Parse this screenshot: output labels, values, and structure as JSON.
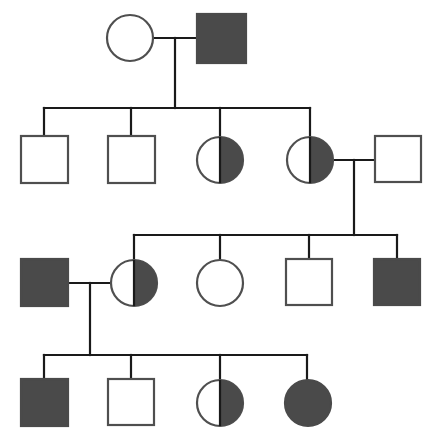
{
  "figure": {
    "kind": "pedigree-chart",
    "width": 439,
    "height": 447,
    "background_color": "#ffffff"
  },
  "style": {
    "line_color": "#1a1a1a",
    "line_width": 2.2,
    "shape_stroke_color": "#4f4f4f",
    "shape_stroke_width": 2.2,
    "affected_fill": "#4a4a4a",
    "unaffected_fill": "#ffffff",
    "carrier_fill": "#4a4a4a",
    "divider_color": "#1a1a1a"
  },
  "legend_semantics": {
    "square": "male",
    "circle": "female",
    "filled": "affected",
    "half-filled": "carrier",
    "empty": "unaffected"
  },
  "chart_data": {
    "type": "pedigree",
    "title": "",
    "generations": 4,
    "individuals": [
      {
        "id": "I-1",
        "generation": 1,
        "sex": "female",
        "shape": "circle",
        "status": "unaffected",
        "fill": "empty",
        "cx": 130,
        "cy": 38,
        "r": 23
      },
      {
        "id": "I-2",
        "generation": 1,
        "sex": "male",
        "shape": "square",
        "status": "affected",
        "fill": "full",
        "x": 197,
        "y": 14,
        "size": 49
      },
      {
        "id": "II-1",
        "generation": 2,
        "sex": "male",
        "shape": "square",
        "status": "unaffected",
        "fill": "empty",
        "x": 21,
        "y": 136,
        "size": 47
      },
      {
        "id": "II-2",
        "generation": 2,
        "sex": "male",
        "shape": "square",
        "status": "unaffected",
        "fill": "empty",
        "x": 108,
        "y": 136,
        "size": 47
      },
      {
        "id": "II-3",
        "generation": 2,
        "sex": "female",
        "shape": "circle",
        "status": "carrier",
        "fill": "half",
        "cx": 220,
        "cy": 160,
        "r": 23
      },
      {
        "id": "II-4",
        "generation": 2,
        "sex": "female",
        "shape": "circle",
        "status": "carrier",
        "fill": "half",
        "cx": 310,
        "cy": 160,
        "r": 23
      },
      {
        "id": "II-5",
        "generation": 2,
        "sex": "male",
        "shape": "square",
        "status": "unaffected",
        "fill": "empty",
        "x": 375,
        "y": 136,
        "size": 46
      },
      {
        "id": "III-1",
        "generation": 3,
        "sex": "male",
        "shape": "square",
        "status": "affected",
        "fill": "full",
        "x": 21,
        "y": 259,
        "size": 47
      },
      {
        "id": "III-2",
        "generation": 3,
        "sex": "female",
        "shape": "circle",
        "status": "carrier",
        "fill": "half",
        "cx": 134,
        "cy": 283,
        "r": 23
      },
      {
        "id": "III-3",
        "generation": 3,
        "sex": "female",
        "shape": "circle",
        "status": "unaffected",
        "fill": "empty",
        "cx": 220,
        "cy": 283,
        "r": 23
      },
      {
        "id": "III-4",
        "generation": 3,
        "sex": "male",
        "shape": "square",
        "status": "unaffected",
        "fill": "empty",
        "x": 286,
        "y": 259,
        "size": 46
      },
      {
        "id": "III-5",
        "generation": 3,
        "sex": "male",
        "shape": "square",
        "status": "affected",
        "fill": "full",
        "x": 374,
        "y": 259,
        "size": 46
      },
      {
        "id": "IV-1",
        "generation": 4,
        "sex": "male",
        "shape": "square",
        "status": "affected",
        "fill": "full",
        "x": 21,
        "y": 379,
        "size": 47
      },
      {
        "id": "IV-2",
        "generation": 4,
        "sex": "male",
        "shape": "square",
        "status": "unaffected",
        "fill": "empty",
        "x": 108,
        "y": 379,
        "size": 46
      },
      {
        "id": "IV-3",
        "generation": 4,
        "sex": "female",
        "shape": "circle",
        "status": "carrier",
        "fill": "half",
        "cx": 220,
        "cy": 403,
        "r": 23
      },
      {
        "id": "IV-4",
        "generation": 4,
        "sex": "female",
        "shape": "circle",
        "status": "affected",
        "fill": "full",
        "cx": 308,
        "cy": 403,
        "r": 23
      }
    ],
    "matings": [
      {
        "id": "M1",
        "partners": [
          "I-1",
          "I-2"
        ],
        "line_y": 38,
        "x_start": 153,
        "x_end": 197,
        "drop_x": 175,
        "drop_to_y": 108
      },
      {
        "id": "M2",
        "partners": [
          "II-4",
          "II-5"
        ],
        "line_y": 160,
        "x_start": 333,
        "x_end": 375,
        "drop_x": 354,
        "drop_to_y": 235
      },
      {
        "id": "M3",
        "partners": [
          "III-1",
          "III-2"
        ],
        "line_y": 283,
        "x_start": 68,
        "x_end": 111,
        "drop_x": 90,
        "drop_to_y": 355
      }
    ],
    "sibships": [
      {
        "id": "S1",
        "parents": "M1",
        "bar_y": 108,
        "bar_x_start": 44,
        "bar_x_end": 310,
        "children": [
          {
            "ref": "II-1",
            "drop_x": 44,
            "drop_to_y": 136
          },
          {
            "ref": "II-2",
            "drop_x": 131,
            "drop_to_y": 136
          },
          {
            "ref": "II-3",
            "drop_x": 220,
            "drop_to_y": 137
          },
          {
            "ref": "II-4",
            "drop_x": 310,
            "drop_to_y": 137
          }
        ]
      },
      {
        "id": "S2",
        "parents": "M2",
        "bar_y": 235,
        "bar_x_start": 134,
        "bar_x_end": 397,
        "children": [
          {
            "ref": "III-2",
            "drop_x": 134,
            "drop_to_y": 260
          },
          {
            "ref": "III-3",
            "drop_x": 220,
            "drop_to_y": 260
          },
          {
            "ref": "III-4",
            "drop_x": 309,
            "drop_to_y": 259
          },
          {
            "ref": "III-5",
            "drop_x": 397,
            "drop_to_y": 259
          }
        ]
      },
      {
        "id": "S3",
        "parents": "M3",
        "bar_y": 355,
        "bar_x_start": 44,
        "bar_x_end": 307,
        "children": [
          {
            "ref": "IV-1",
            "drop_x": 44,
            "drop_to_y": 379
          },
          {
            "ref": "IV-2",
            "drop_x": 131,
            "drop_to_y": 379
          },
          {
            "ref": "IV-3",
            "drop_x": 220,
            "drop_to_y": 380
          },
          {
            "ref": "IV-4",
            "drop_x": 307,
            "drop_to_y": 380
          }
        ]
      }
    ]
  }
}
